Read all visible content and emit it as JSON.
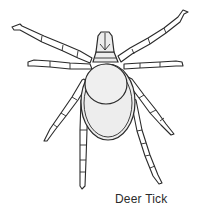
{
  "illustration": {
    "subject": "deer-tick",
    "style": "line-art",
    "colors": {
      "outline": "#2a2a2a",
      "body_fill": "#ededed",
      "background": "#ffffff"
    }
  },
  "caption": {
    "text": "Deer Tick"
  }
}
